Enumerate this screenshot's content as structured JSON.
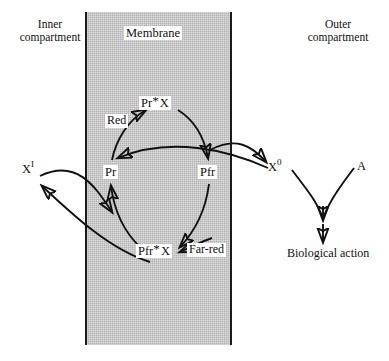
{
  "diagram": {
    "compartments": {
      "inner": "Inner\ncompartment",
      "inner_line1": "Inner",
      "inner_line2": "compartment",
      "outer_line1": "Outer",
      "outer_line2": "compartment",
      "membrane": "Membrane"
    },
    "nodes": {
      "pr_x": {
        "base": "Pr",
        "marker": "*",
        "partner": "X",
        "full": "Pr*X"
      },
      "pfr_x": {
        "base": "Pfr",
        "marker": "*",
        "partner": "X",
        "full": "Pfr*X"
      },
      "pr": "Pr",
      "pfr": "Pfr",
      "x_inner_base": "X",
      "x_inner_sup": "I",
      "x_inner_full": "X I",
      "x_outer_base": "X",
      "x_outer_sup": "0",
      "x_outer_full": "X 0",
      "a": "A",
      "biological_action": "Biological action"
    },
    "light_labels": {
      "red": "Red",
      "far_red": "Far-red"
    },
    "colors": {
      "membrane_fill": "#b3b3b3",
      "membrane_edge": "#1a1a1a",
      "stroke": "#111111",
      "background": "#ffffff"
    }
  }
}
